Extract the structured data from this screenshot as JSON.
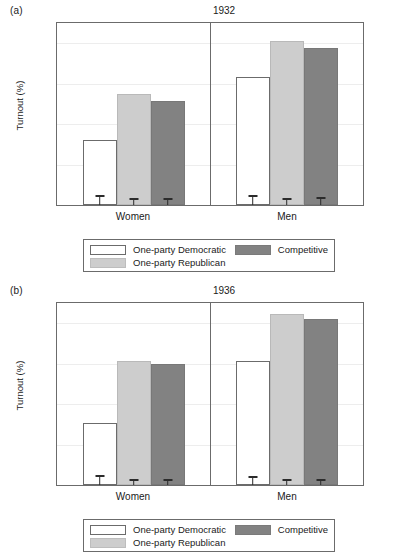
{
  "figure": {
    "ylabel": "Turnout (%)",
    "yticks": [
      "0",
      "20",
      "40",
      "60",
      "80"
    ],
    "xcategories": [
      "Women",
      "Men"
    ]
  },
  "legend": {
    "items": [
      {
        "key": "dem",
        "label": "One-party Democratic",
        "color": "#ffffff"
      },
      {
        "key": "rep",
        "label": "One-party Republican",
        "color": "#cdcdcd"
      },
      {
        "key": "comp",
        "label": "Competitive",
        "color": "#828282"
      }
    ]
  },
  "panels": [
    {
      "tag": "(a)",
      "title": "1932"
    },
    {
      "tag": "(b)",
      "title": "1936"
    }
  ],
  "chart_data": [
    {
      "type": "bar",
      "title": "1932",
      "panel": "(a)",
      "xlabel": "",
      "ylabel": "Turnout (%)",
      "ylim": [
        0,
        90
      ],
      "yticks": [
        0,
        20,
        40,
        60,
        80
      ],
      "grid": true,
      "legend_position": "below-plot",
      "categories": [
        "Women",
        "Men"
      ],
      "series": [
        {
          "name": "One-party Democratic",
          "values": [
            32.0,
            63.5
          ],
          "errors": [
            3.5,
            3.5
          ]
        },
        {
          "name": "One-party Republican",
          "values": [
            55.0,
            81.0
          ],
          "errors": [
            2.0,
            2.0
          ]
        },
        {
          "name": "Competitive",
          "values": [
            51.5,
            77.5
          ],
          "errors": [
            2.0,
            2.5
          ]
        }
      ]
    },
    {
      "type": "bar",
      "title": "1936",
      "panel": "(b)",
      "xlabel": "",
      "ylabel": "Turnout (%)",
      "ylim": [
        0,
        90
      ],
      "yticks": [
        0,
        20,
        40,
        60,
        80
      ],
      "grid": true,
      "legend_position": "below-plot",
      "categories": [
        "Women",
        "Men"
      ],
      "series": [
        {
          "name": "One-party Democratic",
          "values": [
            30.5,
            61.5
          ],
          "errors": [
            3.5,
            3.0
          ]
        },
        {
          "name": "One-party Republican",
          "values": [
            61.5,
            84.5
          ],
          "errors": [
            1.5,
            1.5
          ]
        },
        {
          "name": "Competitive",
          "values": [
            60.0,
            82.0
          ],
          "errors": [
            1.5,
            1.5
          ]
        }
      ]
    }
  ]
}
